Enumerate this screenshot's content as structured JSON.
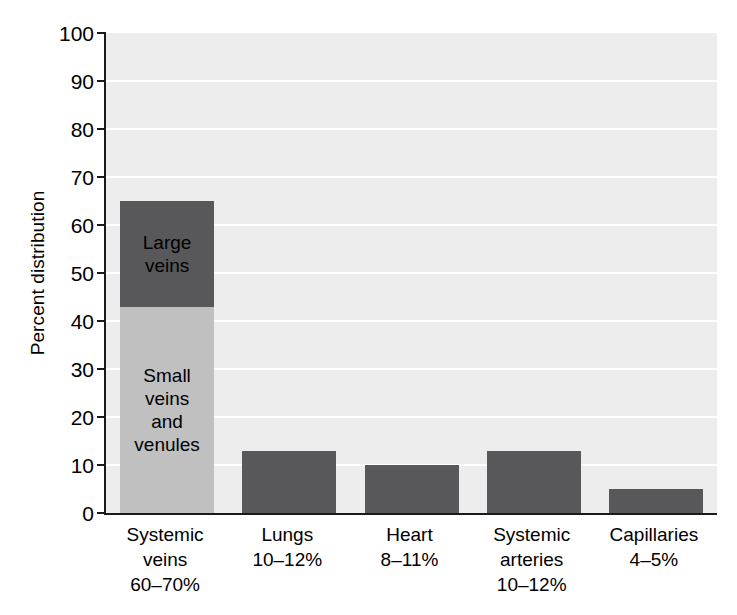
{
  "chart_data": {
    "type": "bar",
    "title": "",
    "xlabel": "",
    "ylabel": "Percent distribution",
    "ylim": [
      0,
      100
    ],
    "ytick_step": 10,
    "grid": true,
    "legend": "none",
    "categories": [
      "Systemic veins",
      "Lungs",
      "Heart",
      "Systemic arteries",
      "Capillaries"
    ],
    "category_ranges": [
      "60–70%",
      "10–12%",
      "8–11%",
      "10–12%",
      "4–5%"
    ],
    "values": [
      65,
      13,
      10,
      13,
      5
    ],
    "bars": [
      {
        "category": "Systemic veins",
        "range": "60–70%",
        "total": 65,
        "stacked": true,
        "segments": [
          {
            "label": "Small veins\nand\nvenules",
            "from": 0,
            "to": 43,
            "value": 43,
            "color": "#c0c0c0"
          },
          {
            "label": "Large\nveins",
            "from": 43,
            "to": 65,
            "value": 22,
            "color": "#58585a"
          }
        ]
      },
      {
        "category": "Lungs",
        "range": "10–12%",
        "total": 13,
        "stacked": false,
        "segments": [
          {
            "label": "",
            "from": 0,
            "to": 13,
            "value": 13,
            "color": "#58585a"
          }
        ]
      },
      {
        "category": "Heart",
        "range": "8–11%",
        "total": 10,
        "stacked": false,
        "segments": [
          {
            "label": "",
            "from": 0,
            "to": 10,
            "value": 10,
            "color": "#58585a"
          }
        ]
      },
      {
        "category": "Systemic arteries",
        "range": "10–12%",
        "total": 13,
        "stacked": false,
        "segments": [
          {
            "label": "",
            "from": 0,
            "to": 13,
            "value": 13,
            "color": "#58585a"
          }
        ]
      },
      {
        "category": "Capillaries",
        "range": "4–5%",
        "total": 5,
        "stacked": false,
        "segments": [
          {
            "label": "",
            "from": 0,
            "to": 5,
            "value": 5,
            "color": "#58585a"
          }
        ]
      }
    ],
    "yticks": [
      0,
      10,
      20,
      30,
      40,
      50,
      60,
      70,
      80,
      90,
      100
    ],
    "ytick_labels": [
      "0",
      "10",
      "20",
      "30",
      "40",
      "50",
      "60",
      "70",
      "80",
      "90",
      "100"
    ],
    "colors": {
      "bar_dark": "#58585a",
      "bar_light": "#c0c0c0",
      "plot_background": "#ededed",
      "gridline": "#ffffff",
      "axis": "#1a1a1a",
      "text": "#000000",
      "page_background": "#ffffff"
    },
    "x_labels": [
      "Systemic\nveins\n60–70%",
      "Lungs\n10–12%",
      "Heart\n8–11%",
      "Systemic\narteries\n10–12%",
      "Capillaries\n4–5%"
    ]
  }
}
